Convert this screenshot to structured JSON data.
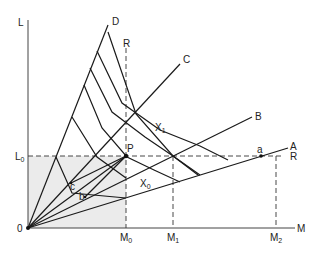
{
  "diagram": {
    "type": "activity-analysis-isoquant",
    "axes": {
      "x_label": "M",
      "y_label": "L",
      "origin_label": "0"
    },
    "rays": [
      {
        "id": "A",
        "label": "A"
      },
      {
        "id": "B",
        "label": "B"
      },
      {
        "id": "C",
        "label": "C"
      },
      {
        "id": "D",
        "label": "D"
      }
    ],
    "constraint_label": "R",
    "constraint_label_vertical": "R",
    "ticks": {
      "y": [
        {
          "label": "L",
          "sub": "0"
        }
      ],
      "x": [
        {
          "label": "M",
          "sub": "0"
        },
        {
          "label": "M",
          "sub": "1"
        },
        {
          "label": "M",
          "sub": "2"
        }
      ]
    },
    "isoquants": [
      {
        "label": "X",
        "sub": "0"
      },
      {
        "label": "X",
        "sub": "1"
      }
    ],
    "points": [
      {
        "label": "P"
      },
      {
        "label": "a"
      },
      {
        "label": "b"
      },
      {
        "label": "c"
      }
    ],
    "shaded_region": "feasible region 0–M0 × 0–L0",
    "colors": {
      "line": "#1a1a1a",
      "shade": "#ebebeb",
      "background": "#ffffff"
    }
  }
}
